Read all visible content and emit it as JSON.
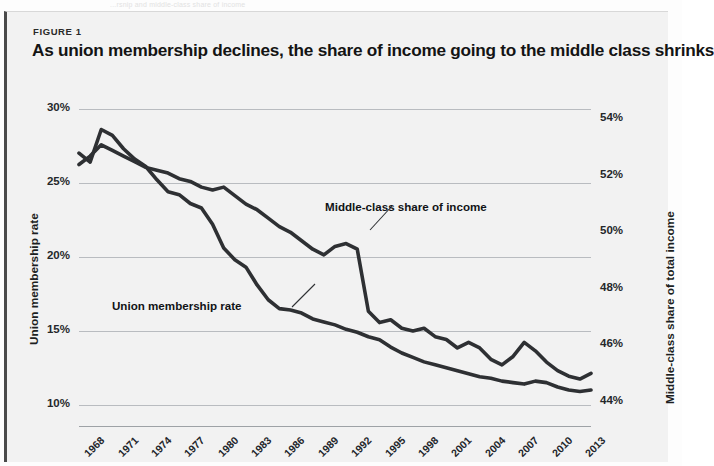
{
  "page": {
    "bleed_text": "...rsnip and middle-class share of income"
  },
  "figure": {
    "figure_label": "FIGURE 1",
    "title": "As union membership declines, the share of income going to the middle class shrinks"
  },
  "chart_data": {
    "type": "line",
    "title": "As union membership declines, the share of income going to the middle class shrinks",
    "xlabel": "",
    "ylabel": "Union membership rate",
    "y2label": "Middle-class share of total income",
    "grid": true,
    "legend_position": "inline-annotation",
    "x": [
      1967,
      1968,
      1969,
      1970,
      1971,
      1972,
      1973,
      1974,
      1975,
      1976,
      1977,
      1978,
      1979,
      1980,
      1981,
      1982,
      1983,
      1984,
      1985,
      1986,
      1987,
      1988,
      1989,
      1990,
      1991,
      1992,
      1993,
      1994,
      1995,
      1996,
      1997,
      1998,
      1999,
      2000,
      2001,
      2002,
      2003,
      2004,
      2005,
      2006,
      2007,
      2008,
      2009,
      2010,
      2011,
      2012,
      2013
    ],
    "xticks": [
      "1968",
      "1971",
      "1974",
      "1977",
      "1980",
      "1983",
      "1986",
      "1989",
      "1992",
      "1995",
      "1998",
      "2001",
      "2004",
      "2007",
      "2010",
      "2013"
    ],
    "yticks_left": [
      "30%",
      "25%",
      "20%",
      "15%",
      "10%"
    ],
    "yticks_right": [
      "54%",
      "52%",
      "50%",
      "48%",
      "46%",
      "44%"
    ],
    "ylim_left": [
      8.5,
      31.0
    ],
    "ylim_right": [
      43.1,
      54.9
    ],
    "series": [
      {
        "name": "Union membership rate",
        "axis": "left",
        "color": "#2e3033",
        "values": [
          27.0,
          26.4,
          28.6,
          28.2,
          27.3,
          26.6,
          26.1,
          25.2,
          24.4,
          24.2,
          23.6,
          23.3,
          22.2,
          20.6,
          19.8,
          19.3,
          18.1,
          17.1,
          16.5,
          16.4,
          16.2,
          15.8,
          15.6,
          15.4,
          15.1,
          14.9,
          14.6,
          14.4,
          13.9,
          13.5,
          13.2,
          12.9,
          12.7,
          12.5,
          12.3,
          12.1,
          11.9,
          11.8,
          11.6,
          11.5,
          11.4,
          11.6,
          11.5,
          11.2,
          11.0,
          10.9,
          11.0
        ]
      },
      {
        "name": "Middle-class share of income",
        "axis": "right",
        "color": "#2e3033",
        "values": [
          52.4,
          52.7,
          53.1,
          52.9,
          52.7,
          52.5,
          52.3,
          52.2,
          52.1,
          51.9,
          51.8,
          51.6,
          51.5,
          51.6,
          51.3,
          51.0,
          50.8,
          50.5,
          50.2,
          50.0,
          49.7,
          49.4,
          49.2,
          49.5,
          49.6,
          49.4,
          47.2,
          46.8,
          46.9,
          46.6,
          46.5,
          46.6,
          46.3,
          46.2,
          45.9,
          46.1,
          45.9,
          45.5,
          45.3,
          45.6,
          46.1,
          45.8,
          45.4,
          45.1,
          44.9,
          44.8,
          45.0
        ]
      }
    ],
    "annotations": [
      {
        "text": "Middle-class share of income",
        "series": "Middle-class share of income"
      },
      {
        "text": "Union membership rate",
        "series": "Union membership rate"
      }
    ]
  }
}
